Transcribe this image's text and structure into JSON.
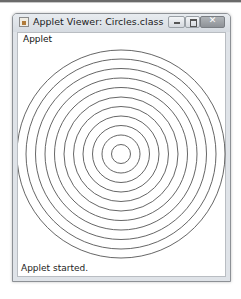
{
  "window": {
    "title": "Applet Viewer: Circles.class",
    "menu_label": "Applet",
    "status_text": "Applet started.",
    "buttons": {
      "minimize_icon": "minimize-icon",
      "maximize_icon": "maximize-icon",
      "close_icon": "close-icon",
      "close_glyph": "✕"
    }
  },
  "drawing": {
    "shape": "concentric-circles",
    "count": 11,
    "center": [
      121,
      154
    ],
    "radius_step": 9.5,
    "stroke_color": "#555555",
    "radii": [
      9.5,
      19,
      28.5,
      38,
      47.5,
      57,
      66.5,
      76,
      85.5,
      95,
      104
    ]
  }
}
